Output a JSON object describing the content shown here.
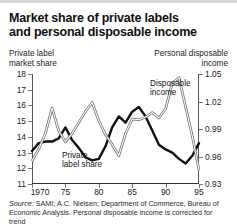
{
  "title": {
    "line1": "Market share of private labels",
    "line2": "and personal disposable income"
  },
  "axis_titles": {
    "left_line1": "Private label",
    "left_line2": "market share",
    "right_line1": "Personal disposable",
    "right_line2": "income"
  },
  "annotations": {
    "private_line1": "Private",
    "private_line2": "label share",
    "disposable_line1": "Disposable",
    "disposable_line2": "income"
  },
  "source": {
    "label": "Source:",
    "text": " SAMI; A.C. Nielsen; Department of Commerce, Bureau of Economic Analysis. Personal disposable income is corrected for trend"
  },
  "chart_data": {
    "type": "line",
    "title": "Market share of private labels and personal disposable income",
    "xlabel": "",
    "ylabel": "Private label market share",
    "y2label": "Personal disposable income",
    "grid": false,
    "legend": "inline-annotations",
    "xlim": [
      1970,
      1995
    ],
    "xticks": [
      1970,
      1975,
      1980,
      1985,
      1990,
      1995
    ],
    "xticklabels": [
      "1970",
      "75",
      "80",
      "85",
      "90",
      "95"
    ],
    "ylim": [
      11,
      18
    ],
    "yticks": [
      11,
      12,
      13,
      14,
      15,
      16,
      17,
      18
    ],
    "yticklabels": [
      "11",
      "12",
      "13",
      "14",
      "15",
      "16",
      "17",
      "18"
    ],
    "y2lim": [
      0.93,
      1.05
    ],
    "y2ticks": [
      0.93,
      0.96,
      0.99,
      1.02,
      1.05
    ],
    "y2ticklabels": [
      "0.93",
      "0.96",
      "0.99",
      "1.02",
      "1.05"
    ],
    "series": [
      {
        "name": "Private label share",
        "axis": "left",
        "style": "thick-black",
        "color": "#111111",
        "x": [
          1970,
          1971,
          1972,
          1973,
          1974,
          1975,
          1976,
          1977,
          1978,
          1979,
          1980,
          1981,
          1982,
          1983,
          1984,
          1985,
          1986,
          1987,
          1988,
          1989,
          1990,
          1991,
          1992,
          1993,
          1994,
          1995
        ],
        "values": [
          13.1,
          13.6,
          13.7,
          13.7,
          13.9,
          14.6,
          13.8,
          13.3,
          12.7,
          12.5,
          12.6,
          13.4,
          14.6,
          15.3,
          14.9,
          15.6,
          15.9,
          15.3,
          14.4,
          13.5,
          13.2,
          13.0,
          12.6,
          12.3,
          12.8,
          13.6
        ]
      },
      {
        "name": "Disposable income",
        "axis": "right",
        "style": "thin-outline-gray",
        "color": "#8a8a8a",
        "x": [
          1970,
          1971,
          1972,
          1973,
          1974,
          1975,
          1976,
          1977,
          1978,
          1979,
          1980,
          1981,
          1982,
          1983,
          1984,
          1985,
          1986,
          1987,
          1988,
          1989,
          1990,
          1991,
          1992,
          1993,
          1994,
          1995
        ],
        "values": [
          0.955,
          0.968,
          0.985,
          1.013,
          0.988,
          0.976,
          0.985,
          0.997,
          1.009,
          1.019,
          0.999,
          0.984,
          0.973,
          0.961,
          0.985,
          1.001,
          1.0,
          1.003,
          1.008,
          1.002,
          1.012,
          1.04,
          1.046,
          1.014,
          0.982,
          0.945
        ]
      }
    ]
  }
}
